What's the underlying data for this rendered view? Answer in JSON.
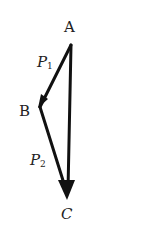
{
  "diagram": {
    "type": "vector-triangle",
    "colors": {
      "line": "#111111",
      "text": "#222222",
      "background": "#ffffff"
    },
    "points": {
      "A": {
        "label": "A",
        "x": 71,
        "y": 45
      },
      "B": {
        "label": "B",
        "x": 40,
        "y": 107
      },
      "C": {
        "label": "C",
        "x": 68,
        "y": 198
      }
    },
    "vectors": [
      {
        "from": "A",
        "to": "B",
        "label": "P",
        "subscript": "1"
      },
      {
        "from": "B",
        "to": "C",
        "label": "P",
        "subscript": "2"
      },
      {
        "from": "A",
        "to": "C",
        "label": ""
      }
    ],
    "labels": {
      "A": "A",
      "B": "B",
      "C": "C",
      "P1_main": "P",
      "P1_sub": "1",
      "P2_main": "P",
      "P2_sub": "2"
    }
  }
}
